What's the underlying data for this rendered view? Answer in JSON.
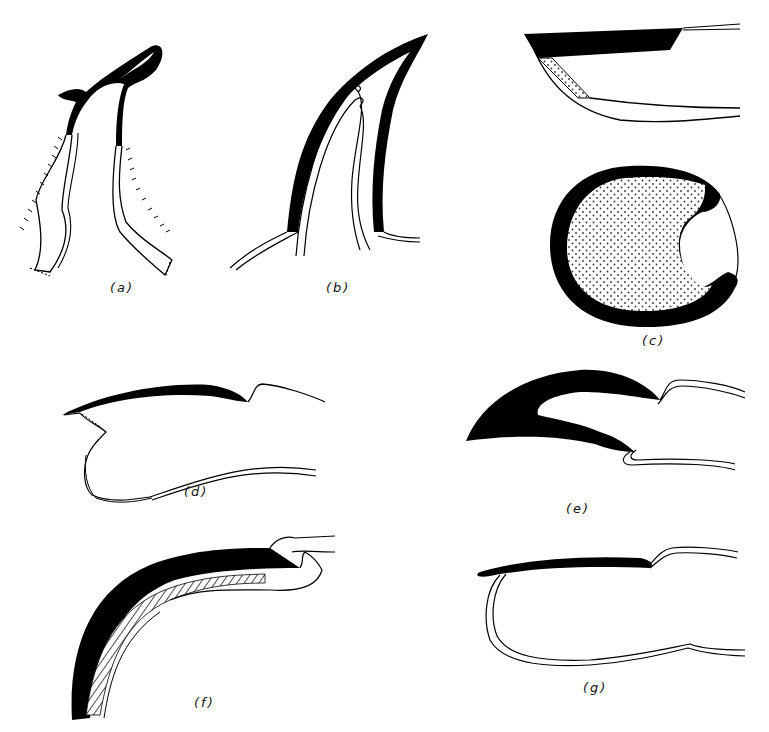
{
  "figure": {
    "ink_color": "#000000",
    "background_color": "#ffffff",
    "stipple_color": "#444444",
    "panels": [
      {
        "id": "a",
        "label": "(a)",
        "label_x": 118,
        "label_y": 288
      },
      {
        "id": "b",
        "label": "(b)",
        "label_x": 332,
        "label_y": 288
      },
      {
        "id": "c",
        "label": "(c)",
        "label_x": 649,
        "label_y": 342
      },
      {
        "id": "d",
        "label": "(d)",
        "label_x": 185,
        "label_y": 482
      },
      {
        "id": "e",
        "label": "(e)",
        "label_x": 570,
        "label_y": 502
      },
      {
        "id": "f",
        "label": "(f)",
        "label_x": 199,
        "label_y": 702
      },
      {
        "id": "g",
        "label": "(g)",
        "label_x": 587,
        "label_y": 687
      }
    ]
  }
}
